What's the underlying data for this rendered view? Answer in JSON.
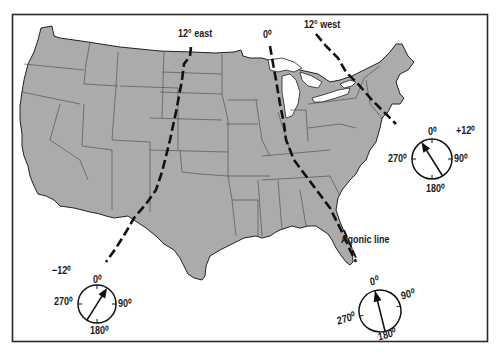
{
  "figure": {
    "map_fill": "#ababab",
    "border_color": "#2a2a2a",
    "line_color": "#111111"
  },
  "isogonic_lines": [
    {
      "id": "east",
      "label": "12° east",
      "value": "12°"
    },
    {
      "id": "agonic",
      "label": "0⁰",
      "value": "0°"
    },
    {
      "id": "west",
      "label": "12° west",
      "value": "12°"
    }
  ],
  "agonic_label": "Agonic line",
  "compasses": [
    {
      "id": "west-compass",
      "declination_label": "−12⁰",
      "north": "0⁰",
      "east": "90⁰",
      "south": "180⁰",
      "west": "270⁰",
      "needle_deg": 30
    },
    {
      "id": "east-compass",
      "declination_label": "+12⁰",
      "north": "0⁰",
      "east": "90⁰",
      "south": "180⁰",
      "west": "270⁰",
      "needle_deg": -30
    },
    {
      "id": "agonic-compass",
      "declination_label": "",
      "north": "0⁰",
      "east": "90⁰",
      "south": "180⁰",
      "west": "270⁰",
      "needle_deg": -12
    }
  ]
}
